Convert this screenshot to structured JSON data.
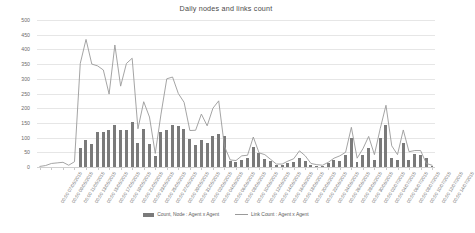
{
  "chart_data": {
    "type": "bar",
    "title": "Daily nodes and links count",
    "xlabel": "",
    "ylabel": "",
    "ylim": [
      0,
      500
    ],
    "ytick_step": 50,
    "yticks": [
      0,
      50,
      100,
      150,
      200,
      250,
      300,
      350,
      400,
      450,
      500
    ],
    "grid": true,
    "legend_position": "bottom",
    "x_tick_interval": 2,
    "x_label_rotation": -58,
    "categories": [
      "00:00 07/05/2015",
      "00:00 08/05/2015",
      "00:00 09/05/2015",
      "00:00 10/05/2015",
      "00:00 11/05/2015",
      "00:00 12/05/2015",
      "00:00 13/05/2015",
      "00:00 14/05/2015",
      "00:00 15/05/2015",
      "00:00 16/05/2015",
      "00:00 17/05/2015",
      "00:00 18/05/2015",
      "00:00 19/05/2015",
      "00:00 20/05/2015",
      "00:00 21/05/2015",
      "00:00 22/05/2015",
      "00:00 23/05/2015",
      "00:00 24/05/2015",
      "00:00 25/05/2015",
      "00:00 26/05/2015",
      "00:00 27/05/2015",
      "00:00 28/05/2015",
      "00:00 29/05/2015",
      "00:00 30/05/2015",
      "00:00 31/05/2015",
      "00:00 01/06/2015",
      "00:00 02/06/2015",
      "00:00 03/06/2015",
      "00:00 04/06/2015",
      "00:00 05/06/2015",
      "00:00 06/06/2015",
      "00:00 07/06/2015",
      "00:00 08/06/2015",
      "00:00 09/06/2015",
      "00:00 10/06/2015",
      "00:00 11/06/2015",
      "00:00 12/06/2015",
      "00:00 13/06/2015",
      "00:00 14/06/2015",
      "00:00 15/06/2015",
      "00:00 16/06/2015",
      "00:00 17/06/2015",
      "00:00 18/06/2015",
      "00:00 19/06/2015",
      "00:00 20/06/2015",
      "00:00 21/06/2015",
      "00:00 22/06/2015",
      "00:00 23/06/2015",
      "00:00 24/06/2015",
      "00:00 25/06/2015",
      "00:00 26/06/2015",
      "00:00 27/06/2015",
      "00:00 28/06/2015",
      "00:00 29/06/2015",
      "00:00 30/06/2015",
      "00:00 01/07/2015",
      "00:00 02/07/2015",
      "00:00 03/07/2015",
      "00:00 04/07/2015",
      "00:00 05/07/2015",
      "00:00 06/07/2015",
      "00:00 07/07/2015",
      "00:00 08/07/2015",
      "00:00 09/07/2015",
      "00:00 10/07/2015",
      "00:00 11/07/2015",
      "00:00 12/07/2015",
      "00:00 13/07/2015",
      "00:00 14/07/2015"
    ],
    "x_tick_labels": [
      "00:00 07/05/2015",
      "00:00 09/05/2015",
      "00:00 11/05/2015",
      "00:00 13/05/2015",
      "00:00 15/05/2015",
      "00:00 17/05/2015",
      "00:00 19/05/2015",
      "00:00 21/05/2015",
      "00:00 23/05/2015",
      "00:00 25/05/2015",
      "00:00 27/05/2015",
      "00:00 29/05/2015",
      "00:00 31/05/2015",
      "00:00 02/06/2015",
      "00:00 04/06/2015",
      "00:00 06/06/2015",
      "00:00 08/06/2015",
      "00:00 10/06/2015",
      "00:00 12/06/2015",
      "00:00 14/06/2015",
      "00:00 16/06/2015",
      "00:00 18/06/2015",
      "00:00 20/06/2015",
      "00:00 22/06/2015",
      "00:00 24/06/2015",
      "00:00 26/06/2015",
      "00:00 28/06/2015",
      "00:00 30/06/2015",
      "00:00 02/07/2015",
      "00:00 04/07/2015",
      "00:00 06/07/2015",
      "00:00 08/07/2015",
      "00:00 10/07/2015",
      "00:00 12/07/2015",
      "00:00 14/07/2015"
    ],
    "series": [
      {
        "name": "Count, Node : Agent x Agent",
        "type": "bar",
        "color": "#7a7a7a",
        "values": [
          0,
          0,
          0,
          0,
          0,
          0,
          0,
          65,
          92,
          77,
          120,
          118,
          126,
          142,
          126,
          126,
          152,
          82,
          128,
          79,
          38,
          120,
          126,
          143,
          141,
          130,
          96,
          75,
          92,
          82,
          104,
          112,
          104,
          20,
          18,
          23,
          30,
          68,
          46,
          28,
          20,
          8,
          8,
          14,
          16,
          32,
          22,
          8,
          5,
          2,
          12,
          24,
          22,
          40,
          100,
          18,
          40,
          65,
          23,
          98,
          142,
          30,
          25,
          80,
          25,
          43,
          42,
          30,
          4
        ]
      },
      {
        "name": "Link Count : Agent x Agent",
        "type": "line",
        "color": "#9a9a9a",
        "values": [
          2,
          5,
          12,
          14,
          16,
          6,
          18,
          352,
          434,
          350,
          344,
          330,
          248,
          415,
          275,
          352,
          370,
          130,
          222,
          170,
          46,
          180,
          300,
          306,
          250,
          220,
          124,
          125,
          180,
          140,
          200,
          225,
          70,
          24,
          22,
          38,
          40,
          102,
          48,
          42,
          26,
          10,
          10,
          20,
          28,
          55,
          38,
          12,
          8,
          6,
          16,
          30,
          38,
          50,
          135,
          30,
          62,
          104,
          42,
          130,
          210,
          72,
          42,
          126,
          52,
          56,
          56,
          12,
          6
        ]
      }
    ]
  },
  "legend": {
    "bar_label": "Count, Node : Agent x Agent",
    "line_label": "Link Count : Agent x Agent"
  }
}
